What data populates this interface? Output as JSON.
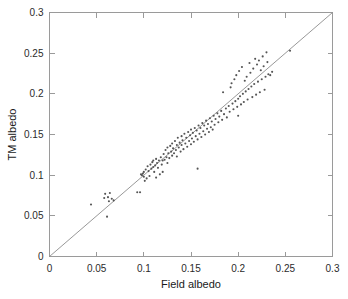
{
  "chart_data": {
    "type": "scatter",
    "title": "",
    "xlabel": "Field albedo",
    "ylabel": "TM albedo",
    "xlim": [
      0,
      0.3
    ],
    "ylim": [
      0,
      0.3
    ],
    "xticks": [
      0,
      0.05,
      0.1,
      0.15,
      0.2,
      0.25,
      0.3
    ],
    "yticks": [
      0,
      0.05,
      0.1,
      0.15,
      0.2,
      0.25,
      0.3
    ],
    "xticklabels": [
      "0",
      "0.05",
      "0.1",
      "0.15",
      "0.2",
      "0.25",
      "0.3"
    ],
    "yticklabels": [
      "0",
      "0.05",
      "0.1",
      "0.15",
      "0.2",
      "0.25",
      "0.3"
    ],
    "grid": false,
    "legend": null,
    "marker": "dot",
    "marker_color": "#555555",
    "reference_line": {
      "name": "one-to-one line",
      "from": [
        0,
        0
      ],
      "to": [
        0.3,
        0.3
      ],
      "color": "#8c8c8c"
    },
    "series": [
      {
        "name": "albedo observations",
        "points": [
          [
            0.044,
            0.064
          ],
          [
            0.058,
            0.072
          ],
          [
            0.059,
            0.077
          ],
          [
            0.061,
            0.049
          ],
          [
            0.062,
            0.073
          ],
          [
            0.063,
            0.068
          ],
          [
            0.064,
            0.078
          ],
          [
            0.066,
            0.071
          ],
          [
            0.068,
            0.069
          ],
          [
            0.093,
            0.079
          ],
          [
            0.096,
            0.079
          ],
          [
            0.097,
            0.101
          ],
          [
            0.098,
            0.1
          ],
          [
            0.099,
            0.102
          ],
          [
            0.1,
            0.098
          ],
          [
            0.1,
            0.104
          ],
          [
            0.101,
            0.093
          ],
          [
            0.102,
            0.107
          ],
          [
            0.103,
            0.096
          ],
          [
            0.104,
            0.111
          ],
          [
            0.105,
            0.105
          ],
          [
            0.106,
            0.099
          ],
          [
            0.107,
            0.113
          ],
          [
            0.108,
            0.108
          ],
          [
            0.109,
            0.116
          ],
          [
            0.11,
            0.11
          ],
          [
            0.11,
            0.118
          ],
          [
            0.111,
            0.104
          ],
          [
            0.112,
            0.112
          ],
          [
            0.113,
            0.12
          ],
          [
            0.113,
            0.097
          ],
          [
            0.114,
            0.115
          ],
          [
            0.115,
            0.109
          ],
          [
            0.116,
            0.118
          ],
          [
            0.117,
            0.101
          ],
          [
            0.118,
            0.122
          ],
          [
            0.119,
            0.113
          ],
          [
            0.12,
            0.118
          ],
          [
            0.12,
            0.104
          ],
          [
            0.121,
            0.126
          ],
          [
            0.122,
            0.119
          ],
          [
            0.123,
            0.131
          ],
          [
            0.124,
            0.122
          ],
          [
            0.125,
            0.115
          ],
          [
            0.125,
            0.134
          ],
          [
            0.126,
            0.127
          ],
          [
            0.127,
            0.121
          ],
          [
            0.128,
            0.136
          ],
          [
            0.129,
            0.129
          ],
          [
            0.13,
            0.124
          ],
          [
            0.13,
            0.139
          ],
          [
            0.131,
            0.133
          ],
          [
            0.132,
            0.127
          ],
          [
            0.133,
            0.142
          ],
          [
            0.134,
            0.131
          ],
          [
            0.135,
            0.137
          ],
          [
            0.135,
            0.123
          ],
          [
            0.136,
            0.146
          ],
          [
            0.137,
            0.134
          ],
          [
            0.138,
            0.14
          ],
          [
            0.139,
            0.129
          ],
          [
            0.14,
            0.148
          ],
          [
            0.14,
            0.137
          ],
          [
            0.141,
            0.143
          ],
          [
            0.142,
            0.132
          ],
          [
            0.143,
            0.151
          ],
          [
            0.144,
            0.139
          ],
          [
            0.145,
            0.146
          ],
          [
            0.146,
            0.135
          ],
          [
            0.147,
            0.153
          ],
          [
            0.148,
            0.142
          ],
          [
            0.149,
            0.149
          ],
          [
            0.15,
            0.138
          ],
          [
            0.15,
            0.156
          ],
          [
            0.151,
            0.145
          ],
          [
            0.152,
            0.152
          ],
          [
            0.153,
            0.141
          ],
          [
            0.154,
            0.158
          ],
          [
            0.155,
            0.148
          ],
          [
            0.156,
            0.155
          ],
          [
            0.157,
            0.108
          ],
          [
            0.157,
            0.144
          ],
          [
            0.158,
            0.161
          ],
          [
            0.159,
            0.151
          ],
          [
            0.16,
            0.158
          ],
          [
            0.161,
            0.147
          ],
          [
            0.162,
            0.164
          ],
          [
            0.163,
            0.154
          ],
          [
            0.164,
            0.161
          ],
          [
            0.165,
            0.15
          ],
          [
            0.166,
            0.167
          ],
          [
            0.167,
            0.157
          ],
          [
            0.168,
            0.163
          ],
          [
            0.169,
            0.153
          ],
          [
            0.17,
            0.17
          ],
          [
            0.171,
            0.159
          ],
          [
            0.172,
            0.166
          ],
          [
            0.173,
            0.156
          ],
          [
            0.174,
            0.173
          ],
          [
            0.175,
            0.162
          ],
          [
            0.176,
            0.169
          ],
          [
            0.178,
            0.176
          ],
          [
            0.179,
            0.165
          ],
          [
            0.18,
            0.172
          ],
          [
            0.182,
            0.179
          ],
          [
            0.183,
            0.168
          ],
          [
            0.184,
            0.202
          ],
          [
            0.185,
            0.175
          ],
          [
            0.187,
            0.182
          ],
          [
            0.188,
            0.171
          ],
          [
            0.19,
            0.185
          ],
          [
            0.191,
            0.178
          ],
          [
            0.192,
            0.208
          ],
          [
            0.193,
            0.213
          ],
          [
            0.194,
            0.188
          ],
          [
            0.195,
            0.181
          ],
          [
            0.196,
            0.218
          ],
          [
            0.197,
            0.191
          ],
          [
            0.198,
            0.223
          ],
          [
            0.199,
            0.184
          ],
          [
            0.2,
            0.194
          ],
          [
            0.2,
            0.173
          ],
          [
            0.201,
            0.228
          ],
          [
            0.202,
            0.197
          ],
          [
            0.203,
            0.187
          ],
          [
            0.204,
            0.233
          ],
          [
            0.205,
            0.2
          ],
          [
            0.206,
            0.19
          ],
          [
            0.207,
            0.216
          ],
          [
            0.208,
            0.203
          ],
          [
            0.209,
            0.221
          ],
          [
            0.21,
            0.193
          ],
          [
            0.211,
            0.206
          ],
          [
            0.212,
            0.238
          ],
          [
            0.213,
            0.226
          ],
          [
            0.214,
            0.209
          ],
          [
            0.215,
            0.196
          ],
          [
            0.216,
            0.231
          ],
          [
            0.217,
            0.212
          ],
          [
            0.218,
            0.243
          ],
          [
            0.219,
            0.199
          ],
          [
            0.22,
            0.236
          ],
          [
            0.221,
            0.215
          ],
          [
            0.222,
            0.241
          ],
          [
            0.223,
            0.202
          ],
          [
            0.224,
            0.229
          ],
          [
            0.225,
            0.218
          ],
          [
            0.226,
            0.246
          ],
          [
            0.227,
            0.234
          ],
          [
            0.228,
            0.205
          ],
          [
            0.229,
            0.221
          ],
          [
            0.23,
            0.251
          ],
          [
            0.231,
            0.239
          ],
          [
            0.232,
            0.224
          ],
          [
            0.234,
            0.223
          ],
          [
            0.236,
            0.227
          ],
          [
            0.255,
            0.253
          ]
        ]
      }
    ]
  }
}
